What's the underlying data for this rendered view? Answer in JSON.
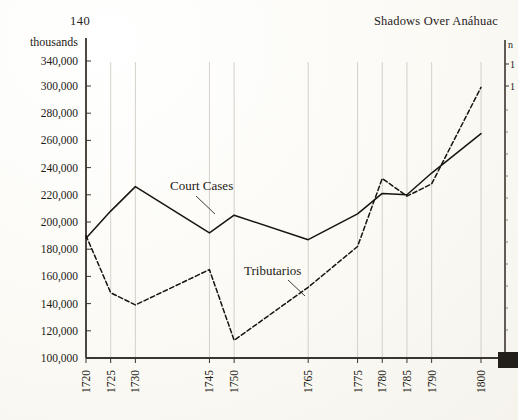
{
  "page": {
    "number": "140",
    "running_head": "Shadows Over Anáhuac"
  },
  "chart_data": {
    "type": "line",
    "title": "",
    "xlabel": "",
    "ylabel": "thousands",
    "grid": "vertical-only",
    "legend": "inline-annotations",
    "axis_note": "y-axis compressed between 300,000 and 340,000",
    "ylim": [
      100000,
      340000
    ],
    "ytick_labels": [
      "340,000",
      "300,000",
      "280,000",
      "260,000",
      "240,000",
      "220,000",
      "200,000",
      "180,000",
      "160,000",
      "140,000",
      "120,000",
      "100,000"
    ],
    "ytick_values": [
      340000,
      300000,
      280000,
      260000,
      240000,
      220000,
      200000,
      180000,
      160000,
      140000,
      120000,
      100000
    ],
    "categories": [
      "1720",
      "1725",
      "1730",
      "1745",
      "1750",
      "1765",
      "1775",
      "1780",
      "1785",
      "1790",
      "1800"
    ],
    "x_numeric": [
      1720,
      1725,
      1730,
      1745,
      1750,
      1765,
      1775,
      1780,
      1785,
      1790,
      1800
    ],
    "series": [
      {
        "name": "Court Cases",
        "style": "solid",
        "values": [
          188000,
          208000,
          226000,
          192000,
          205000,
          187000,
          206000,
          221000,
          220000,
          236000,
          265000
        ]
      },
      {
        "name": "Tributarios",
        "style": "dashed",
        "values": [
          190000,
          148000,
          139000,
          165000,
          113000,
          152000,
          182000,
          232000,
          219000,
          228000,
          299000
        ]
      }
    ],
    "annotations": [
      {
        "text": "Court Cases",
        "series": "Court Cases"
      },
      {
        "text": "Tributarios",
        "series": "Tributarios"
      }
    ],
    "right_axis_partial": {
      "unit_fragment": "n",
      "tick_fragments": [
        "1",
        "1"
      ]
    }
  }
}
